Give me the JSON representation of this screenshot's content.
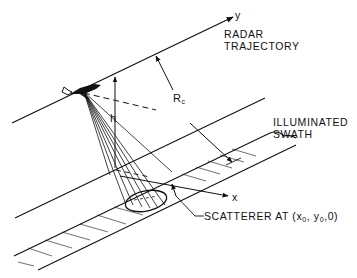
{
  "diagram": {
    "labels": {
      "y_axis": "y",
      "x_axis": "x",
      "radar_line1": "RADAR",
      "radar_line2": "TRAJECTORY",
      "height": "h",
      "range_main": "R",
      "range_sub": "c",
      "swath_line1": "ILLUMINATED",
      "swath_line2": "SWATH",
      "scatterer_prefix": "SCATTERER AT (x",
      "scatterer_sub1": "0",
      "scatterer_mid1": ", y",
      "scatterer_sub2": "0",
      "scatterer_suffix": ",0)"
    },
    "colors": {
      "ink": "#111111",
      "background": "#ffffff"
    }
  }
}
